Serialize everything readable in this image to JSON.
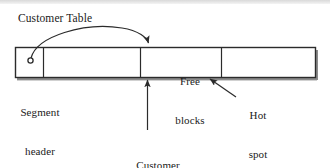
{
  "diagram": {
    "title_text": "Customer Table",
    "labels": {
      "customer_table": "Customer Table",
      "free_blocks_line1": "Free",
      "free_blocks_line2": "blocks",
      "segment_header_line1": "Segment",
      "segment_header_line2": "header",
      "hot_spot_line1": "Hot",
      "hot_spot_line2": "spot",
      "customer_inserts_line1": "Customer",
      "customer_inserts_line2": "inserts"
    },
    "segments": [
      {
        "name": "segment-header-cell",
        "label": ""
      },
      {
        "name": "used-blocks-cell",
        "label": ""
      },
      {
        "name": "free-blocks-cell",
        "label": "Free blocks"
      },
      {
        "name": "tail-cell",
        "label": ""
      }
    ],
    "colors": {
      "stroke": "#2b2b2b",
      "text": "#1a1a1a",
      "background": "#ffffff",
      "box_fill": "#ffffff",
      "shadow": "#808080"
    },
    "annotations": [
      {
        "name": "customer-table-pointer",
        "from": "Customer Table",
        "to": "free-blocks-boundary"
      },
      {
        "name": "customer-inserts-pointer",
        "from": "Customer inserts",
        "to": "free-blocks-left-edge"
      },
      {
        "name": "hot-spot-pointer",
        "from": "Hot spot",
        "to": "free-blocks-right-region"
      }
    ]
  }
}
